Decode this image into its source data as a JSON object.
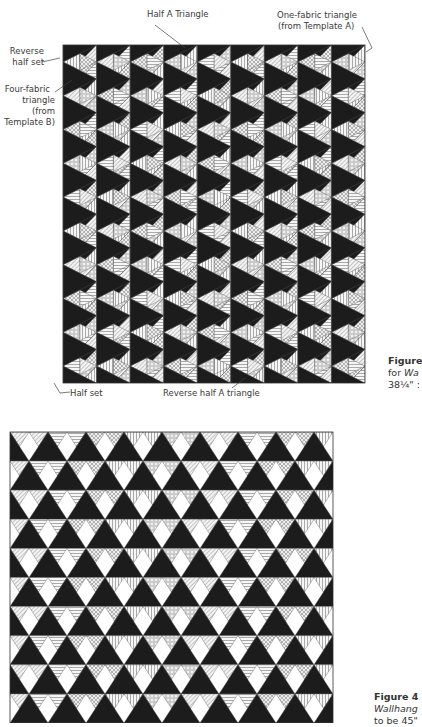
{
  "figure_top": {
    "labels": {
      "half_a_triangle": "Half A Triangle",
      "one_fabric_line1": "One-fabric triangle",
      "one_fabric_line2": "(from Template A)",
      "reverse_half_set_line1": "Reverse",
      "reverse_half_set_line2": "half set",
      "four_fabric_line1": "Four-fabric",
      "four_fabric_line2": "triangle",
      "four_fabric_line3": "(from",
      "four_fabric_line4": "Template B)",
      "half_set": "Half set",
      "reverse_half_a": "Reverse half A triangle"
    },
    "caption": {
      "line1_bold": "Figure",
      "line2_prefix": "for ",
      "line2_italic": "Wa",
      "line3": "38¼\" :"
    },
    "layout": {
      "x": 63,
      "y": 45,
      "width": 302,
      "height": 338,
      "columns": 9,
      "rows": 10,
      "orientation": "vertical-columns"
    }
  },
  "figure_bottom": {
    "caption": {
      "line1_bold": "Figure  4",
      "line2_italic": "Wallhang",
      "line3": "to be 45\""
    },
    "layout": {
      "x": 10,
      "y": 432,
      "width": 323,
      "height": 291,
      "columns": 8.5,
      "rows": 10,
      "orientation": "horizontal-rows"
    }
  },
  "colors": {
    "dark_fabric": "#1c1c1c",
    "light_fabric_bg": "#f4f4f4",
    "line": "#555555",
    "paper": "#ffffff"
  }
}
